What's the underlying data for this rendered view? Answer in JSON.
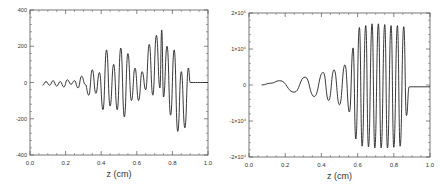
{
  "chart_data": [
    {
      "type": "line",
      "title": "",
      "xlabel": "z (cm)",
      "ylabel": "",
      "xlim": [
        0.0,
        1.0
      ],
      "ylim": [
        -400,
        400
      ],
      "xticks": [
        "0.0",
        "0.2",
        "0.4",
        "0.6",
        "0.8",
        "1.0"
      ],
      "yticks": [
        "-400",
        "-200",
        "0",
        "200",
        "400"
      ],
      "grid": false,
      "legend": null,
      "description": "Oscillating signal starting near 0 at z≈0.07, growing amplitude with irregular envelope, peak ~+290 near z≈0.74 and trough ~-270 near z≈0.81, flat at 0 after z≈0.89",
      "x": [
        0.07,
        0.09,
        0.11,
        0.13,
        0.15,
        0.17,
        0.19,
        0.21,
        0.23,
        0.25,
        0.27,
        0.29,
        0.31,
        0.33,
        0.35,
        0.37,
        0.39,
        0.41,
        0.43,
        0.45,
        0.47,
        0.49,
        0.51,
        0.53,
        0.55,
        0.57,
        0.59,
        0.61,
        0.63,
        0.65,
        0.67,
        0.69,
        0.71,
        0.73,
        0.74,
        0.75,
        0.77,
        0.79,
        0.81,
        0.83,
        0.85,
        0.87,
        0.89,
        0.9,
        1.0
      ],
      "y": [
        -15,
        5,
        -15,
        10,
        -20,
        5,
        -25,
        15,
        -10,
        10,
        -30,
        35,
        -10,
        -70,
        70,
        -60,
        55,
        -150,
        180,
        -130,
        100,
        -150,
        190,
        -190,
        160,
        -100,
        80,
        -100,
        60,
        -40,
        210,
        -70,
        260,
        -30,
        290,
        -80,
        200,
        -180,
        180,
        -270,
        60,
        -250,
        80,
        0,
        0
      ]
    },
    {
      "type": "line",
      "title": "",
      "xlabel": "z (cm)",
      "ylabel": "",
      "xlim": [
        0.0,
        1.0
      ],
      "ylim": [
        -20000,
        20000
      ],
      "xticks": [
        "0.0",
        "0.2",
        "0.4",
        "0.6",
        "0.8",
        "1.0"
      ],
      "yticks": [
        "-2×10⁴",
        "-1×10⁴",
        "0",
        "1×10⁴",
        "2×10⁴"
      ],
      "grid": false,
      "legend": null,
      "description": "Chirped oscillation with growing amplitude from z≈0.07, saturating at ~±17000 from z≈0.6 to 0.87, then flat at 0 after z≈0.89",
      "x": [
        0.07,
        0.12,
        0.17,
        0.25,
        0.31,
        0.36,
        0.41,
        0.44,
        0.47,
        0.5,
        0.53,
        0.555,
        0.575,
        0.59,
        0.61,
        0.625,
        0.645,
        0.66,
        0.68,
        0.695,
        0.715,
        0.73,
        0.75,
        0.765,
        0.785,
        0.8,
        0.82,
        0.835,
        0.855,
        0.87,
        0.885,
        0.89,
        1.0
      ],
      "y": [
        0,
        500,
        1200,
        -2000,
        2200,
        -3200,
        3500,
        -4300,
        4200,
        -5500,
        5600,
        -7500,
        10300,
        -15000,
        16000,
        -17000,
        16500,
        -17200,
        17000,
        -17500,
        17000,
        -17500,
        16800,
        -17500,
        16500,
        -17300,
        16500,
        -17000,
        16200,
        -8500,
        -500,
        -500,
        -500
      ]
    }
  ]
}
